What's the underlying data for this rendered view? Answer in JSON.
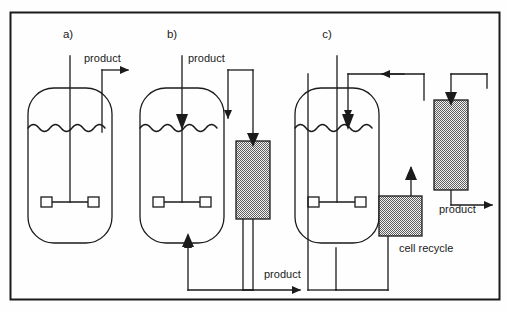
{
  "figure": {
    "background_color": "#fefefe",
    "line_color": "#1b1b1b",
    "hatch_color": "#8a8a8a",
    "border": {
      "x": 10,
      "y": 12,
      "width": 490,
      "height": 288
    }
  },
  "panels": [
    {
      "id": "a",
      "label": "a)",
      "label_x": 68,
      "label_y": 38,
      "description": "batch / simple stirred tank bioreactor with product take-off"
    },
    {
      "id": "b",
      "label": "b)",
      "label_x": 172,
      "label_y": 38,
      "description": "stirred tank with external separator column and recycle loop"
    },
    {
      "id": "c",
      "label": "c)",
      "label_x": 327,
      "label_y": 38,
      "description": "stirred tank with cell recycle unit and external separator column"
    }
  ],
  "labels": [
    {
      "name": "product-label-a",
      "text": "product",
      "x": 84,
      "y": 62
    },
    {
      "name": "product-label-b-top",
      "text": "product",
      "x": 188,
      "y": 62
    },
    {
      "name": "product-label-b-bottom",
      "text": "product",
      "x": 264,
      "y": 278
    },
    {
      "name": "product-label-c",
      "text": "product",
      "x": 439,
      "y": 213
    },
    {
      "name": "cell-recycle-label",
      "text": "cell  recycle",
      "x": 399,
      "y": 252
    }
  ],
  "vessels": [
    {
      "name": "vessel-a",
      "x": 28,
      "y": 88,
      "width": 84,
      "height": 155,
      "radius": 26,
      "liquid_level_y": 128
    },
    {
      "name": "vessel-b",
      "x": 140,
      "y": 88,
      "width": 84,
      "height": 155,
      "radius": 26,
      "liquid_level_y": 128
    },
    {
      "name": "vessel-c",
      "x": 295,
      "y": 88,
      "width": 84,
      "height": 155,
      "radius": 26,
      "liquid_level_y": 128
    }
  ],
  "columns": [
    {
      "name": "separator-column-b",
      "x": 236,
      "y": 141,
      "width": 34,
      "height": 78,
      "fill": "hatched"
    },
    {
      "name": "separator-column-c",
      "x": 434,
      "y": 100,
      "width": 34,
      "height": 90,
      "fill": "hatched"
    },
    {
      "name": "cell-recycle-unit-c",
      "x": 379,
      "y": 196,
      "width": 43,
      "height": 40,
      "fill": "hatched"
    }
  ],
  "impellers": [
    {
      "name": "impeller-a",
      "cx": 70,
      "cy": 202
    },
    {
      "name": "impeller-b",
      "cx": 182,
      "cy": 202
    },
    {
      "name": "impeller-c",
      "cx": 337,
      "cy": 202
    }
  ],
  "flow_arrows": [
    {
      "name": "product-arrow-a",
      "direction": "right"
    },
    {
      "name": "feed-arrow-into-vessel-b",
      "direction": "down"
    },
    {
      "name": "recycle-arrow-into-vessel-b",
      "direction": "up"
    },
    {
      "name": "product-arrow-b",
      "direction": "right"
    },
    {
      "name": "feed-arrow-into-vessel-c",
      "direction": "down"
    },
    {
      "name": "recycle-arrow-left-c",
      "direction": "left"
    },
    {
      "name": "feed-arrow-into-column-c",
      "direction": "down"
    },
    {
      "name": "arrow-into-column-from-cell-recycle-c",
      "direction": "up"
    },
    {
      "name": "product-arrow-c",
      "direction": "right"
    }
  ]
}
